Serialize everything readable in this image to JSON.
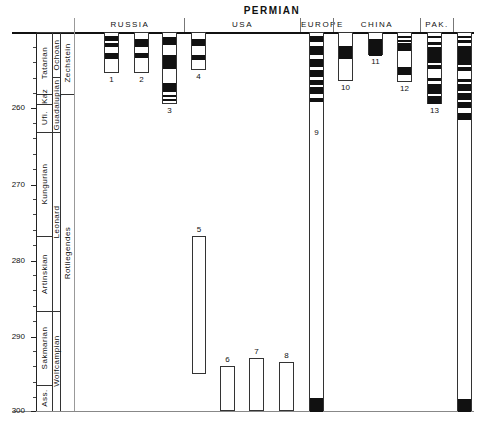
{
  "title": "PERMIAN",
  "regions": [
    {
      "label": "RUSSIA",
      "left": 76,
      "width": 108
    },
    {
      "label": "USA",
      "left": 185,
      "width": 115
    },
    {
      "label": "EUROPE",
      "left": 301,
      "width": 32
    },
    {
      "label": "CHINA",
      "left": 334,
      "width": 86
    },
    {
      "label": "PAK.",
      "left": 421,
      "width": 32
    }
  ],
  "axis": {
    "ticks": [
      {
        "label": "260",
        "y": 108
      },
      {
        "label": "270",
        "y": 185
      },
      {
        "label": "280",
        "y": 261
      },
      {
        "label": "290",
        "y": 337
      },
      {
        "label": "300",
        "y": 411
      }
    ],
    "top_ma": 250,
    "px_per_ma": 7.6
  },
  "stages": [
    {
      "label": "Tatarian",
      "top": 32,
      "bottom": 94
    },
    {
      "label": "Kaz",
      "top": 94,
      "bottom": 104
    },
    {
      "label": "Ufi.",
      "top": 104,
      "bottom": 132
    },
    {
      "label": "Kungurian",
      "top": 132,
      "bottom": 236
    },
    {
      "label": "Artinskian",
      "top": 236,
      "bottom": 311
    },
    {
      "label": "Sakmarian",
      "top": 311,
      "bottom": 385
    },
    {
      "label": "Ass.",
      "top": 385,
      "bottom": 411
    }
  ],
  "series": [
    {
      "label": "Ochoan",
      "top": 32,
      "bottom": 77
    },
    {
      "label": "Guadalupian",
      "top": 77,
      "bottom": 132
    },
    {
      "label": "Leonard",
      "top": 132,
      "bottom": 311
    },
    {
      "label": "Wolfcampian",
      "top": 311,
      "bottom": 411
    }
  ],
  "european": [
    {
      "label": "Zechstein",
      "top": 32,
      "bottom": 94
    },
    {
      "label": "Rotliegendes",
      "top": 94,
      "bottom": 411
    }
  ],
  "columns": [
    {
      "num": "1",
      "left": 104,
      "width": 15,
      "top": 32,
      "bottom": 73,
      "bands": [
        [
          35,
          40
        ],
        [
          42,
          46
        ],
        [
          52,
          58
        ]
      ]
    },
    {
      "num": "2",
      "left": 134,
      "width": 15,
      "top": 32,
      "bottom": 73,
      "bands": [
        [
          38,
          46
        ],
        [
          52,
          57
        ]
      ]
    },
    {
      "num": "3",
      "left": 162,
      "width": 15,
      "top": 32,
      "bottom": 104,
      "bands": [
        [
          36,
          44
        ],
        [
          54,
          68
        ],
        [
          82,
          91
        ],
        [
          94,
          96
        ],
        [
          98,
          100
        ]
      ]
    },
    {
      "num": "4",
      "left": 191,
      "width": 15,
      "top": 32,
      "bottom": 70,
      "bands": [
        [
          38,
          45
        ],
        [
          54,
          59
        ]
      ]
    },
    {
      "num": "5",
      "left": 192,
      "width": 14,
      "top": 236,
      "bottom": 374,
      "bands": []
    },
    {
      "num": "6",
      "left": 220,
      "width": 15,
      "top": 366,
      "bottom": 411,
      "bands": []
    },
    {
      "num": "7",
      "left": 249,
      "width": 15,
      "top": 358,
      "bottom": 411,
      "bands": []
    },
    {
      "num": "8",
      "left": 279,
      "width": 15,
      "top": 362,
      "bottom": 411,
      "bands": []
    },
    {
      "num": "9",
      "left": 309,
      "width": 15,
      "top": 32,
      "bottom": 411,
      "bands": [
        [
          35,
          41
        ],
        [
          45,
          54
        ],
        [
          58,
          66
        ],
        [
          69,
          76
        ],
        [
          79,
          84
        ],
        [
          86,
          93
        ],
        [
          97,
          101
        ],
        [
          397,
          411
        ]
      ]
    },
    {
      "num": "10",
      "left": 338,
      "width": 15,
      "top": 32,
      "bottom": 81,
      "bands": [
        [
          45,
          58
        ]
      ]
    },
    {
      "num": "11",
      "left": 368,
      "width": 15,
      "top": 32,
      "bottom": 55,
      "bands": [
        [
          38,
          55
        ]
      ]
    },
    {
      "num": "12",
      "left": 397,
      "width": 15,
      "top": 32,
      "bottom": 82,
      "bands": [
        [
          35,
          37
        ],
        [
          39,
          41
        ],
        [
          42,
          50
        ],
        [
          66,
          74
        ]
      ]
    },
    {
      "num": "13",
      "left": 427,
      "width": 15,
      "top": 32,
      "bottom": 104,
      "bands": [
        [
          35,
          37
        ],
        [
          41,
          44
        ],
        [
          46,
          62
        ],
        [
          64,
          68
        ],
        [
          77,
          80
        ],
        [
          83,
          93
        ],
        [
          95,
          103
        ]
      ]
    },
    {
      "num": "",
      "left": 457,
      "width": 15,
      "top": 32,
      "bottom": 411,
      "bands": [
        [
          35,
          37
        ],
        [
          39,
          42
        ],
        [
          45,
          64
        ],
        [
          66,
          70
        ],
        [
          78,
          81
        ],
        [
          83,
          90
        ],
        [
          92,
          99
        ],
        [
          101,
          107
        ],
        [
          112,
          119
        ],
        [
          398,
          411
        ]
      ]
    }
  ]
}
